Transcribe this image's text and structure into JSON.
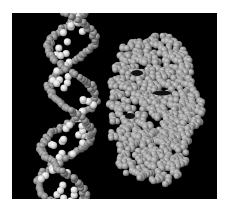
{
  "image": {
    "description": "Space-filling molecular model: DNA double helix (left) beside a globular protein (right), grayscale on black background",
    "background": "#000000",
    "page_background": "#ffffff",
    "colors": {
      "backbone": "#8a8a8a",
      "backbone_highlight": "#b8b8b8",
      "bases": "#d8d8d8",
      "bases_highlight": "#f2f2f2",
      "protein": "#9a9a9a",
      "protein_highlight": "#c8c8c8"
    },
    "frame": {
      "x": 12,
      "y": 13,
      "width": 205,
      "height": 186
    }
  }
}
